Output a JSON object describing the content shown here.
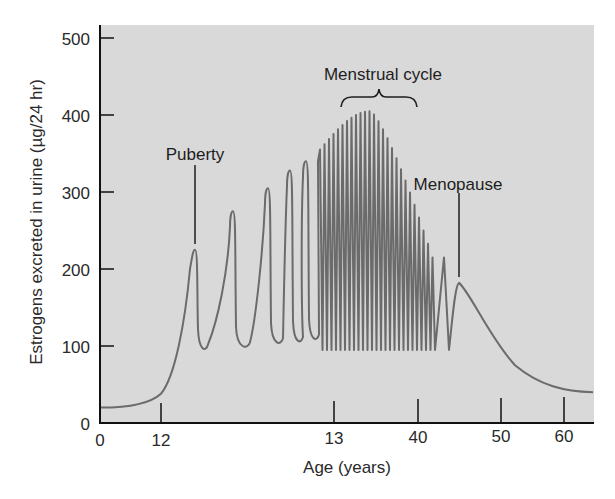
{
  "chart_data": {
    "type": "line",
    "title": "",
    "xlabel": "Age (years)",
    "ylabel": "Estrogens excreted in urine (µg/24 hr)",
    "ylim": [
      0,
      500
    ],
    "yticks": [
      0,
      100,
      200,
      300,
      400,
      500
    ],
    "xticks": [
      "0",
      "12",
      "13",
      "40",
      "50",
      "60"
    ],
    "x_axis_note": "Non-linear (broken) age axis: 12–13 region expanded to show individual cycles",
    "grid": false,
    "legend": null,
    "background": "#d9d9d9",
    "line_color": "#6b6b6b",
    "series": [
      {
        "name": "Estrogen excretion",
        "phases": [
          {
            "phase": "childhood",
            "age_range": [
              0,
              12
            ],
            "values": [
              20,
              20,
              22,
              30,
              45
            ]
          },
          {
            "phase": "puberty onset cycles",
            "peaks": [
              225,
              275,
              305,
              328,
              340
            ],
            "troughs": [
              92,
              95,
              100,
              102,
              105
            ]
          },
          {
            "phase": "menstrual cycles",
            "age_range": [
              13,
              40
            ],
            "peak_max": 405,
            "peak_start": 355,
            "peak_end": 215,
            "troughs": 95,
            "cycle_count": 26
          },
          {
            "phase": "menopause",
            "peak": 182,
            "age_range": [
              40,
              50
            ]
          },
          {
            "phase": "post-menopause",
            "age_range": [
              50,
              64
            ],
            "values": [
              182,
              120,
              70,
              50,
              42,
              40
            ]
          }
        ]
      }
    ],
    "annotations": [
      {
        "text": "Puberty",
        "points_to_value": 225
      },
      {
        "text": "Menstrual cycle",
        "type": "brace",
        "span": "13–40"
      },
      {
        "text": "Menopause",
        "points_to_value": 182
      }
    ]
  },
  "labels": {
    "y_axis_title": "Estrogens excreted in urine (µg/24 hr)",
    "x_axis_title": "Age (years)",
    "y_ticks": [
      "500",
      "400",
      "300",
      "200",
      "100",
      "0"
    ],
    "x_ticks": [
      "0",
      "12",
      "13",
      "40",
      "50",
      "60"
    ],
    "puberty": "Puberty",
    "menstrual_cycle": "Menstrual cycle",
    "menopause": "Menopause"
  }
}
